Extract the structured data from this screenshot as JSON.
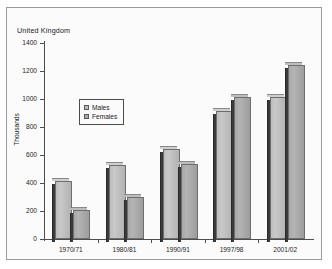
{
  "chart_data": {
    "type": "bar",
    "title": "United Kingdom",
    "xlabel": "",
    "ylabel": "Thousands",
    "ylim": [
      0,
      1400
    ],
    "yticks": [
      0,
      200,
      400,
      600,
      800,
      1000,
      1200,
      1400
    ],
    "ytick_labels": [
      "0",
      "200",
      "400",
      "600",
      "800",
      "1000",
      "1200",
      "1400"
    ],
    "grid": false,
    "legend_position": "upper-left-inside",
    "categories": [
      "1970/71",
      "1980/81",
      "1990/91",
      "1997/98",
      "2001/02"
    ],
    "series": [
      {
        "name": "Males",
        "color": "#bdbdbd",
        "values": [
          415,
          530,
          640,
          915,
          1015
        ]
      },
      {
        "name": "Females",
        "color": "#a8a8a8",
        "values": [
          210,
          300,
          535,
          1015,
          1240
        ]
      }
    ]
  },
  "legend": {
    "items": [
      {
        "label": "Males",
        "swatch": "#bdbdbd"
      },
      {
        "label": "Females",
        "swatch": "#a8a8a8"
      }
    ]
  },
  "colors": {
    "males": "#bdbdbd",
    "females": "#a8a8a8",
    "axis": "#4d4d4d",
    "frame": "#9a9a9a",
    "background": "#fbfbfb",
    "text": "#1b1b1b"
  }
}
